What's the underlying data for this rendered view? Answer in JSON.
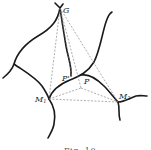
{
  "figure": {
    "caption": "Fig. 10",
    "points": {
      "G": {
        "label": "G",
        "x": 60,
        "y": 8
      },
      "M1": {
        "label": "M",
        "sub": "1",
        "x": 49,
        "y": 99
      },
      "M2": {
        "label": "M",
        "sub": "2",
        "x": 118,
        "y": 102
      },
      "P": {
        "label": "P",
        "x": 81,
        "y": 88
      },
      "Pprime": {
        "label": "P'",
        "x": 72,
        "y": 77
      }
    },
    "colors": {
      "curve": "#1a1a1a",
      "dashed": "#777777",
      "background": "#ffffff"
    }
  }
}
